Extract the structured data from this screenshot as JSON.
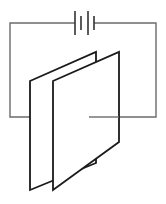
{
  "diagram": {
    "components": [
      {
        "id": "battery",
        "type": "battery",
        "cells": 2,
        "label": ""
      },
      {
        "id": "plate-a",
        "type": "capacitor-plate",
        "label": ""
      },
      {
        "id": "plate-b",
        "type": "capacitor-plate",
        "label": ""
      },
      {
        "id": "wire-left",
        "type": "wire",
        "connects": [
          "battery",
          "plate-a"
        ]
      },
      {
        "id": "wire-right",
        "type": "wire",
        "connects": [
          "battery",
          "plate-b"
        ]
      }
    ],
    "colors": {
      "wire": "#6b6b6b",
      "plate_outline": "#1a1a1a",
      "background": "#ffffff"
    }
  }
}
